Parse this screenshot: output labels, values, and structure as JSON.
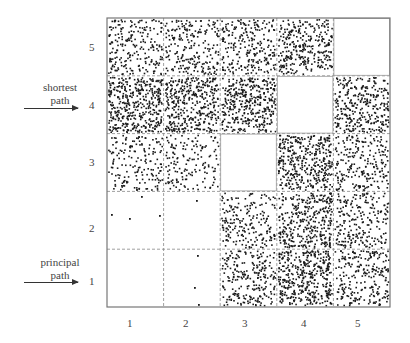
{
  "chart_data": {
    "type": "scatter",
    "title": "",
    "xlabel": "",
    "ylabel": "",
    "grid": "5x5 dashed block grid",
    "x_ticks": [
      "1",
      "2",
      "3",
      "4",
      "5"
    ],
    "y_ticks": [
      "1",
      "2",
      "3",
      "4",
      "5"
    ],
    "annotations": [
      {
        "text_lines": [
          "shortest",
          "path"
        ],
        "points_to_row": "4"
      },
      {
        "text_lines": [
          "principal",
          "path"
        ],
        "points_to_row": "1"
      }
    ],
    "cell_density_description": "approximate number of dots per block; rows listed bottom(1) to top(5), columns 1..5",
    "cells": [
      {
        "row": 1,
        "values": [
          0,
          3,
          240,
          400,
          240
        ]
      },
      {
        "row": 2,
        "values": [
          4,
          1,
          200,
          340,
          220
        ]
      },
      {
        "row": 3,
        "values": [
          170,
          150,
          0,
          380,
          220
        ]
      },
      {
        "row": 4,
        "values": [
          420,
          380,
          380,
          0,
          320
        ]
      },
      {
        "row": 5,
        "values": [
          220,
          220,
          240,
          300,
          0
        ]
      }
    ],
    "empty_diagonal_cells": [
      [
        5,
        5
      ],
      [
        4,
        4
      ],
      [
        3,
        3
      ],
      [
        2,
        2
      ],
      [
        1,
        1
      ]
    ],
    "sparse_points": [
      {
        "x": 111,
        "y": 214
      },
      {
        "x": 129,
        "y": 218
      },
      {
        "x": 141,
        "y": 196
      },
      {
        "x": 159,
        "y": 215
      },
      {
        "x": 196,
        "y": 200
      },
      {
        "x": 197,
        "y": 255
      },
      {
        "x": 194,
        "y": 287
      },
      {
        "x": 198,
        "y": 304
      }
    ]
  },
  "layout": {
    "plot_left": 107,
    "plot_top": 18,
    "cell_w": 56.6,
    "cell_h": 57.8,
    "dot_color": "#1a1a1a",
    "frame_color": "#777777",
    "grid_color": "#888888"
  },
  "labels": {
    "shortest_line1": "shortest",
    "shortest_line2": "path",
    "principal_line1": "principal",
    "principal_line2": "path"
  }
}
